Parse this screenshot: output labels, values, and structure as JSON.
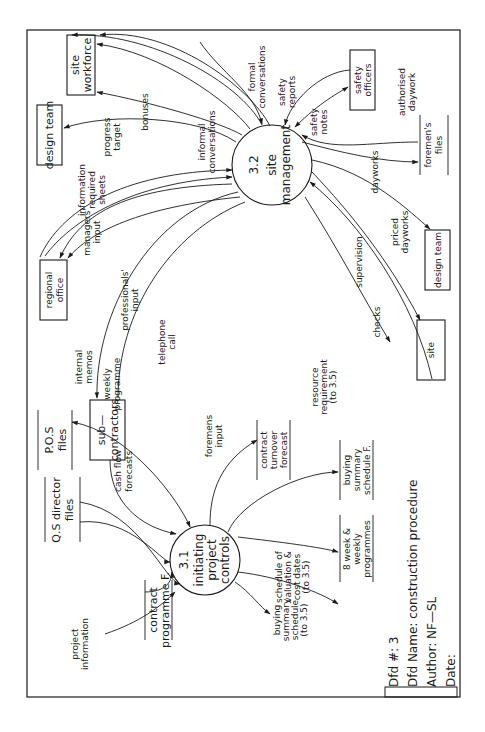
{
  "diagram": {
    "orientation": "rotated 90 degrees counter-clockwise",
    "processes": [
      {
        "id": "3.1",
        "number": "3.1",
        "lines": [
          "initiating",
          "project",
          "controls"
        ]
      },
      {
        "id": "3.2",
        "number": "3.2",
        "lines": [
          "site",
          "management"
        ]
      }
    ],
    "external_entities": [
      {
        "id": "site-workforce",
        "lines": [
          "site",
          "workforce"
        ]
      },
      {
        "id": "design-team-top",
        "lines": [
          "design  team"
        ]
      },
      {
        "id": "regional-office",
        "lines": [
          "regional",
          "office"
        ]
      },
      {
        "id": "sub-contractors",
        "lines": [
          "sub—",
          "contractors"
        ]
      },
      {
        "id": "safety-officers",
        "lines": [
          "safety",
          "officers"
        ]
      },
      {
        "id": "design-team-bottom",
        "lines": [
          "design  team"
        ]
      },
      {
        "id": "site",
        "lines": [
          "site"
        ]
      }
    ],
    "data_stores": [
      {
        "id": "contract-programme",
        "lines": [
          "contract",
          "programme  F."
        ]
      },
      {
        "id": "qs-director-files",
        "lines": [
          "Q.S  director",
          "files"
        ]
      },
      {
        "id": "pos-files",
        "lines": [
          "P.O.S",
          "files"
        ]
      },
      {
        "id": "contract-turnover",
        "lines": [
          "contract",
          "turnover",
          "forecast"
        ]
      },
      {
        "id": "buying-summary",
        "lines": [
          "buying",
          "summary",
          "schedule  F."
        ]
      },
      {
        "id": "week-programmes",
        "lines": [
          "8  week  &",
          "weekly",
          "programmes"
        ]
      },
      {
        "id": "foremens-files",
        "lines": [
          "foremen's",
          "files"
        ]
      }
    ],
    "flows": [
      {
        "id": "project-information",
        "lines": [
          "project",
          "information"
        ]
      },
      {
        "id": "cash-flow-forecasts",
        "lines": [
          "cash  flow",
          "forecasts"
        ]
      },
      {
        "id": "foremens-input",
        "lines": [
          "foremens",
          "input"
        ]
      },
      {
        "id": "buying-summary-schedule",
        "lines": [
          "buying",
          "summary",
          "schedule",
          "(to 3.5)"
        ]
      },
      {
        "id": "schedule-valuation",
        "lines": [
          "schedule of",
          "valuation &",
          "cost dates",
          "(to 3.5)"
        ]
      },
      {
        "id": "internal-memos",
        "lines": [
          "internal",
          "memos"
        ]
      },
      {
        "id": "weekly-programme",
        "lines": [
          "weekly",
          "programme"
        ]
      },
      {
        "id": "resource-requirement",
        "lines": [
          "resource",
          "requirement",
          "(to 3.5)"
        ]
      },
      {
        "id": "telephone-call",
        "lines": [
          "telephone",
          "call"
        ]
      },
      {
        "id": "professionals-input",
        "lines": [
          "professionals'",
          "input"
        ]
      },
      {
        "id": "managers-input",
        "lines": [
          "managers'",
          "input"
        ]
      },
      {
        "id": "information-required-sheets",
        "lines": [
          "information",
          "required",
          "sheets"
        ]
      },
      {
        "id": "progress-target",
        "lines": [
          "progress",
          "target"
        ]
      },
      {
        "id": "bonuses",
        "lines": [
          "bonuses"
        ]
      },
      {
        "id": "informal-conversations",
        "lines": [
          "informal",
          "conversations"
        ]
      },
      {
        "id": "formal-conversations",
        "lines": [
          "formal",
          "conversations"
        ]
      },
      {
        "id": "safety-reports",
        "lines": [
          "safety",
          "reports"
        ]
      },
      {
        "id": "safety-notes",
        "lines": [
          "safety",
          "notes"
        ]
      },
      {
        "id": "authorised-daywork",
        "lines": [
          "authorised",
          "daywork"
        ]
      },
      {
        "id": "dayworks",
        "lines": [
          "dayworks"
        ]
      },
      {
        "id": "priced-dayworks",
        "lines": [
          "priced",
          "dayworks"
        ]
      },
      {
        "id": "supervision",
        "lines": [
          "supervision"
        ]
      },
      {
        "id": "checks",
        "lines": [
          "checks"
        ]
      }
    ]
  },
  "meta": {
    "dfd_number": "Dfd  #:  3",
    "dfd_name": "Dfd  Name:  construction  procedure",
    "author": "Author:  NF—SL",
    "date": "Date:"
  }
}
